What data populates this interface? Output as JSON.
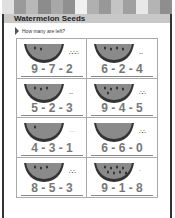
{
  "header": {
    "title": "Watermelon Seeds",
    "stripe_colors": [
      "#e0e0e0",
      "#9a9a9a",
      "#b8b8b8",
      "#8c8c8c",
      "#a8a8a8",
      "#909090",
      "#f0f0f0",
      "#b0b0b0",
      "#989898",
      "#c4c4c4",
      "#a0a0a0",
      "#e8e8e8",
      "#b4b4b4",
      "#8e8e8e"
    ]
  },
  "prompt": "How many are left?",
  "problems": [
    {
      "equation": "9 - 7 - 2",
      "seeds_on_melon": 2,
      "seeds_aside": "∴∴∴"
    },
    {
      "equation": "6 - 2 - 4",
      "seeds_on_melon": 4,
      "seeds_aside": "‥"
    },
    {
      "equation": "5 - 2 - 3",
      "seeds_on_melon": 3,
      "seeds_aside": "‥"
    },
    {
      "equation": "9 - 4 - 5",
      "seeds_on_melon": 5,
      "seeds_aside": "∴∴"
    },
    {
      "equation": "4 - 3 - 1",
      "seeds_on_melon": 1,
      "seeds_aside": "…"
    },
    {
      "equation": "6 - 6 - 0",
      "seeds_on_melon": 0,
      "seeds_aside": "∴∴"
    },
    {
      "equation": "8 - 5 - 3",
      "seeds_on_melon": 3,
      "seeds_aside": "∴∴"
    },
    {
      "equation": "9 - 1 - 8",
      "seeds_on_melon": 8,
      "seeds_aside": "·"
    }
  ]
}
